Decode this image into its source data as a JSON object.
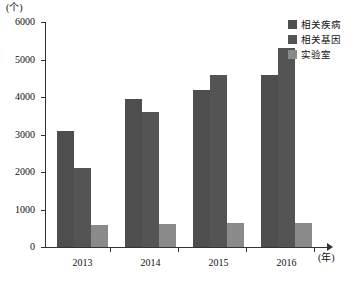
{
  "chart_data": {
    "type": "bar",
    "title": "",
    "subtitle": "",
    "xlabel": "(年)",
    "ylabel": "(个)",
    "categories": [
      "2013",
      "2014",
      "2015",
      "2016"
    ],
    "series": [
      {
        "name": "相关疾病",
        "color": "#4e4e4e",
        "values": [
          3100,
          3950,
          4200,
          4600
        ]
      },
      {
        "name": "相关基因",
        "color": "#545454",
        "values": [
          2100,
          3600,
          4600,
          5300
        ]
      },
      {
        "name": "实验室",
        "color": "#8a8a8a",
        "values": [
          600,
          620,
          630,
          640
        ]
      }
    ],
    "ylim": [
      0,
      6000
    ],
    "ytick_labels": [
      "0",
      "1000",
      "2000",
      "3000",
      "4000",
      "5000",
      "6000"
    ],
    "ytick_values": [
      0,
      1000,
      2000,
      3000,
      4000,
      5000,
      6000
    ],
    "grid": false,
    "legend_position": "top-right",
    "axis_color": "#333333",
    "background": "#ffffff"
  }
}
